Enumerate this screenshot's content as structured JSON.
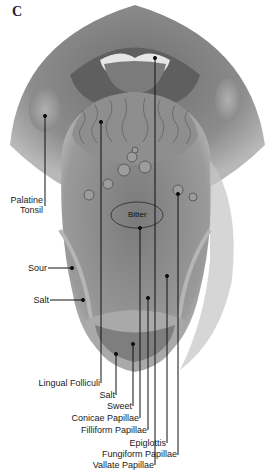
{
  "figure": {
    "panel_letter": "C",
    "colors": {
      "background": "#ffffff",
      "tissue_dark": "#5a5a5a",
      "tissue_mid": "#8a8a8a",
      "tissue_light": "#c8c8c8",
      "line": "#111111"
    }
  },
  "regions": {
    "bitter": "Bitter"
  },
  "labels": {
    "palatine_tonsil_1": "Palatine",
    "palatine_tonsil_2": "Tonsil",
    "sour": "Sour",
    "salt_side": "Salt",
    "lingual_folliculi": "Lingual Folliculi",
    "salt_tip": "Salt",
    "sweet": "Sweet",
    "conicae_papillae": "Conicae Papillae",
    "filliform_papillae": "Filliform Papillae",
    "epiglottis": "Epiglottis",
    "fungiform_papillae": "Fungiform Papillae",
    "vallate_papillae": "Vallate Papillae"
  }
}
